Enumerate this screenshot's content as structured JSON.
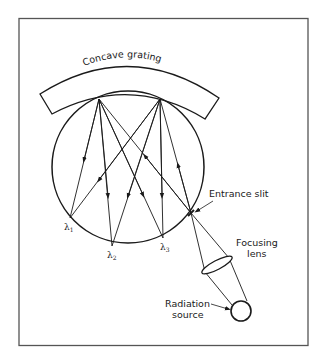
{
  "figure": {
    "labels": {
      "grating": "Concave grating",
      "entrance_slit": "Entrance slit",
      "focusing_lens_line1": "Focusing",
      "focusing_lens_line2": "lens",
      "radiation_source_line1": "Radiation",
      "radiation_source_line2": "source",
      "lambda_symbol": "λ",
      "lambda1_sub": "1",
      "lambda2_sub": "2",
      "lambda3_sub": "3"
    },
    "caption": "",
    "colors": {
      "ink": "#1a1a1a",
      "frame": "#444444",
      "background": "#ffffff"
    }
  }
}
